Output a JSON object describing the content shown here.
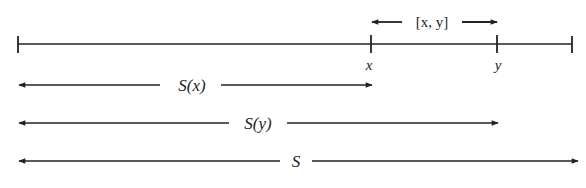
{
  "diagram": {
    "line_color": "#222222",
    "interval_label": "[x, y]",
    "point_x_label": "x",
    "point_y_label": "y",
    "arrows": [
      {
        "name": "S(x)",
        "label": "S(x)"
      },
      {
        "name": "S(y)",
        "label": "S(y)"
      },
      {
        "name": "S",
        "label": "S"
      }
    ]
  }
}
